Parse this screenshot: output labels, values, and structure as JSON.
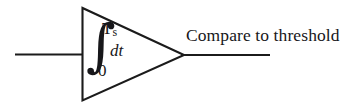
{
  "figure": {
    "type": "block-diagram",
    "background_color": "#ffffff",
    "line_color": "#1b1b1b",
    "text_color": "#17171a"
  },
  "integrator_block": {
    "shape_name": "triangle",
    "integral_symbol": "∫",
    "upper_limit_base": "T",
    "upper_limit_subscript": "s",
    "lower_limit": "0",
    "differential": "dt"
  },
  "wires": {
    "input_label": "",
    "output_label": "Compare to threshold"
  }
}
